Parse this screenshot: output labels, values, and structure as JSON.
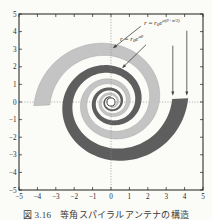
{
  "figure": {
    "caption": "図 3.16　等角スパイラルアンテナの構造"
  },
  "chart_data": {
    "type": "area",
    "title": "",
    "xlabel": "",
    "ylabel": "",
    "xlim": [
      -5,
      5
    ],
    "ylim": [
      -5,
      5
    ],
    "xticks": [
      -5,
      -4,
      -3,
      -2,
      -1,
      0,
      1,
      2,
      3,
      4,
      5
    ],
    "yticks": [
      -5,
      -4,
      -3,
      -2,
      -1,
      0,
      1,
      2,
      3,
      4,
      5
    ],
    "grid": {
      "dotted_vertical_at_x0": true,
      "dotted_horizontal_at_y0": true
    },
    "spiral": {
      "kind": "equiangular-two-arm",
      "growth_rate_a": 0.148,
      "edge_ratio_quarter_turn": 1.262,
      "end_angle_rad": 0.05,
      "end_outer_radius": 4.2,
      "turns": 2.75,
      "feed_circle_radius": 0.22,
      "arms": [
        {
          "name": "arm-dark",
          "rotation_deg": 0,
          "color": "#5e5e5e"
        },
        {
          "name": "arm-light",
          "rotation_deg": 180,
          "color": "#c4c4c4"
        }
      ]
    },
    "colors": {
      "frame": "#1c1c1c",
      "dotted": "#8f8f8f",
      "arrow": "#3f3f3f",
      "text": "#2b2b2b",
      "background": "#fbfbf8"
    },
    "annotations": {
      "labels": [
        {
          "name": "outer-edge-formula",
          "parts": [
            [
              "i",
              "r"
            ],
            [
              "n",
              " = "
            ],
            [
              "i",
              "r"
            ],
            [
              "sub",
              "0"
            ],
            [
              "i",
              "e"
            ],
            [
              "sup",
              "a(θ+π/2)"
            ]
          ],
          "pos": [
            1.79,
            4.4
          ]
        },
        {
          "name": "inner-edge-formula",
          "parts": [
            [
              "i",
              "r"
            ],
            [
              "n",
              " = "
            ],
            [
              "i",
              "r"
            ],
            [
              "sub",
              "0"
            ],
            [
              "i",
              "e"
            ],
            [
              "sup",
              "aθ"
            ]
          ],
          "pos": [
            0.49,
            3.49
          ]
        }
      ],
      "arrows": [
        {
          "name": "arrow-to-outer-edge-curve",
          "from": [
            1.62,
            4.3
          ],
          "to": [
            0.1,
            3.05
          ]
        },
        {
          "name": "arrow-to-inner-edge-curve",
          "from": [
            1.9,
            3.25
          ],
          "to": [
            0.6,
            1.92
          ]
        },
        {
          "name": "arrow-end-inner-radius",
          "from": [
            3.36,
            3.2
          ],
          "to": [
            3.36,
            0.35
          ]
        },
        {
          "name": "arrow-end-outer-radius",
          "from": [
            4.12,
            4.05
          ],
          "to": [
            4.12,
            0.35
          ]
        }
      ]
    }
  }
}
